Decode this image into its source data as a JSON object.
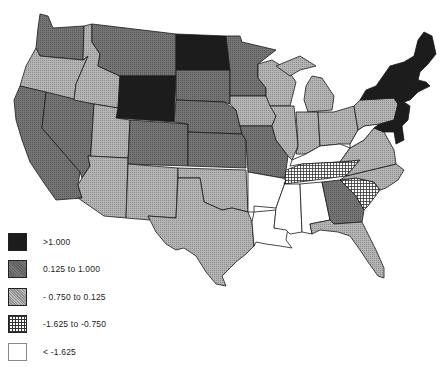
{
  "map": {
    "type": "choropleth",
    "region": "United States (contiguous)",
    "classes": [
      {
        "id": "c1",
        "label": ">1.000",
        "fill": "#1c1c1c",
        "pattern": "solid-dark"
      },
      {
        "id": "c2",
        "label": "0.125  to  1.000",
        "fill": "#6e6e6e",
        "pattern": "dark-stipple"
      },
      {
        "id": "c3",
        "label": "- 0.750  to  0.125",
        "fill": "#a6a6a6",
        "pattern": "light-stipple"
      },
      {
        "id": "c4",
        "label": "-1.625  to  -0.750",
        "fill": "#ffffff",
        "pattern": "crosshatch"
      },
      {
        "id": "c5",
        "label": "<  -1.625",
        "fill": "#ffffff",
        "pattern": "blank"
      }
    ],
    "states": {
      "WA": "c2",
      "OR": "c3",
      "CA": "c2",
      "NV": "c2",
      "ID": "c3",
      "MT": "c2",
      "WY": "c1",
      "UT": "c3",
      "AZ": "c3",
      "CO": "c2",
      "NM": "c3",
      "ND": "c1",
      "SD": "c2",
      "NE": "c2",
      "KS": "c2",
      "OK": "c3",
      "TX": "c3",
      "MN": "c2",
      "IA": "c3",
      "MO": "c2",
      "AR": "c5",
      "LA": "c5",
      "WI": "c3",
      "IL": "c3",
      "MI": "c3",
      "IN": "c3",
      "OH": "c3",
      "KY": "c5",
      "TN": "c4",
      "MS": "c5",
      "AL": "c5",
      "GA": "c2",
      "FL": "c3",
      "SC": "c4",
      "NC": "c3",
      "VA": "c3",
      "WV": "c5",
      "PA": "c3",
      "NY": "c1",
      "VT": "c1",
      "NH": "c1",
      "ME": "c1",
      "MA": "c1",
      "CT": "c1",
      "RI": "c1",
      "NJ": "c1",
      "DE": "c1",
      "MD": "c1"
    }
  },
  "legend": {
    "items": [
      {
        "label": ">1.000"
      },
      {
        "label": "0.125  to  1.000"
      },
      {
        "label": "- 0.750  to  0.125"
      },
      {
        "label": "-1.625  to  -0.750"
      },
      {
        "label": "<  -1.625"
      }
    ]
  }
}
